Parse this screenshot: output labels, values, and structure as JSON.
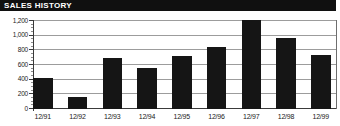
{
  "header": {
    "title": "SALES HISTORY"
  },
  "chart_data": {
    "type": "bar",
    "title": "SALES HISTORY",
    "categories": [
      "12/91",
      "12/92",
      "12/93",
      "12/94",
      "12/95",
      "12/96",
      "12/97",
      "12/98",
      "12/99"
    ],
    "values": [
      420,
      160,
      690,
      560,
      720,
      840,
      1220,
      970,
      740
    ],
    "xlabel": "",
    "ylabel": "",
    "ylim": [
      0,
      1200
    ],
    "yticks": [
      0,
      200,
      400,
      600,
      800,
      1000,
      1200
    ],
    "ytick_labels": [
      "0",
      "200",
      "400",
      "600",
      "800",
      "1,000",
      "1,200"
    ],
    "minor_tick_interval": 50,
    "grid": true,
    "legend_position": "none",
    "bar_color": "#151515",
    "grid_color": "#9c9c9c",
    "axis_color": "#3a3a3a",
    "border_color": "#6e6e6e",
    "title_bar_color": "#101010",
    "title_text_color": "#ffffff"
  }
}
